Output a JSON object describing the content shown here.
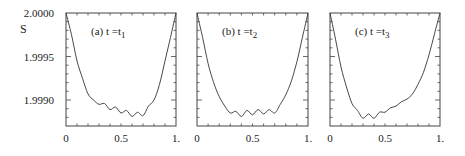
{
  "chart_data": [
    {
      "type": "line",
      "title": "(a) t = t1",
      "panel": "(a)",
      "label_main": "t =t",
      "label_sub": "1",
      "xlabel": "",
      "ylabel": "S",
      "xlim": [
        0,
        1
      ],
      "ylim": [
        1.9987,
        2.0
      ],
      "xticks": [
        "0",
        "0.5",
        "1."
      ],
      "yticks": [
        "2.0000",
        "1.9995",
        "1.9990"
      ],
      "grid": false,
      "x": [
        0,
        0.05,
        0.1,
        0.15,
        0.2,
        0.25,
        0.3,
        0.35,
        0.4,
        0.45,
        0.5,
        0.55,
        0.6,
        0.65,
        0.7,
        0.75,
        0.8,
        0.85,
        0.9,
        0.95,
        1.0
      ],
      "y": [
        2.0,
        1.99975,
        1.99945,
        1.99925,
        1.99907,
        1.999,
        1.99895,
        1.99896,
        1.99889,
        1.99892,
        1.99885,
        1.99888,
        1.99881,
        1.99886,
        1.99882,
        1.99893,
        1.999,
        1.99918,
        1.99945,
        1.99972,
        2.0
      ]
    },
    {
      "type": "line",
      "title": "(b) t = t2",
      "panel": "(b)",
      "label_main": "t =t",
      "label_sub": "2",
      "xlabel": "",
      "ylabel": "",
      "xlim": [
        0,
        1
      ],
      "ylim": [
        1.9987,
        2.0
      ],
      "xticks": [
        "0",
        "0.5",
        "1."
      ],
      "yticks": [],
      "grid": false,
      "x": [
        0,
        0.05,
        0.1,
        0.15,
        0.2,
        0.25,
        0.3,
        0.35,
        0.4,
        0.45,
        0.5,
        0.55,
        0.6,
        0.65,
        0.7,
        0.75,
        0.8,
        0.85,
        0.9,
        0.95,
        1.0
      ],
      "y": [
        2.0,
        1.99972,
        1.99942,
        1.9992,
        1.99904,
        1.99893,
        1.99885,
        1.99887,
        1.99881,
        1.99888,
        1.99883,
        1.99889,
        1.99884,
        1.99889,
        1.99885,
        1.99895,
        1.99906,
        1.99922,
        1.99944,
        1.99972,
        2.0
      ]
    },
    {
      "type": "line",
      "title": "(c) t = t3",
      "panel": "(c)",
      "label_main": "t =t",
      "label_sub": "3",
      "xlabel": "",
      "ylabel": "",
      "xlim": [
        0,
        1
      ],
      "ylim": [
        1.9987,
        2.0
      ],
      "xticks": [
        "0",
        "0.5",
        "1."
      ],
      "yticks": [],
      "grid": false,
      "x": [
        0,
        0.05,
        0.1,
        0.15,
        0.2,
        0.25,
        0.3,
        0.35,
        0.4,
        0.45,
        0.5,
        0.55,
        0.6,
        0.65,
        0.7,
        0.75,
        0.8,
        0.85,
        0.9,
        0.95,
        1.0
      ],
      "y": [
        2.0,
        1.9997,
        1.99938,
        1.99915,
        1.99896,
        1.99888,
        1.99879,
        1.99884,
        1.99879,
        1.99886,
        1.99886,
        1.99891,
        1.99893,
        1.99898,
        1.99901,
        1.99907,
        1.99918,
        1.99932,
        1.99952,
        1.99976,
        2.0
      ]
    }
  ],
  "axis": {
    "ylabel": "S",
    "yticks": [
      "2.0000",
      "1.9995",
      "1.9990"
    ],
    "xticks": [
      "0",
      "0.5",
      "1."
    ]
  }
}
